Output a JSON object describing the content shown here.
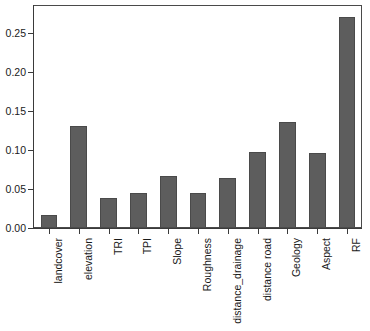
{
  "chart_data": {
    "type": "bar",
    "title": "",
    "subtitle": "",
    "xlabel": "",
    "ylabel": "",
    "categories": [
      "landcover",
      "elevation",
      "TRI",
      "TPI",
      "Slope",
      "Roughness",
      "distance_drainage",
      "distance road",
      "Geology",
      "Aspect",
      "RF"
    ],
    "values": [
      0.017,
      0.131,
      0.038,
      0.045,
      0.067,
      0.045,
      0.064,
      0.097,
      0.136,
      0.096,
      0.27
    ],
    "ylim": [
      0.0,
      0.2858
    ],
    "ytick_values": [
      0.0,
      0.05,
      0.1,
      0.15,
      0.2,
      0.25
    ],
    "ytick_labels": [
      "0.00",
      "0.05",
      "0.10",
      "0.15",
      "0.20",
      "0.25"
    ],
    "grid": false,
    "legend": null,
    "legend_position": "none",
    "bar_color": "#5d5d5d",
    "bar_edge_color": "#4a4a4a",
    "axis_color": "#3a3a3a",
    "background_color": "#ffffff",
    "text_color": "#1a1a1a",
    "xtick_label_rotation": 90
  }
}
